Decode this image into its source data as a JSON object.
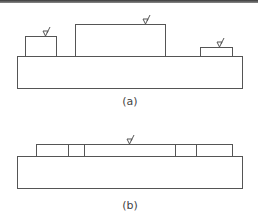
{
  "figure": {
    "panel_a": {
      "label": "(a)",
      "description": "Substrate base with three raised blocks of different heights, each marked with a surface-finish symbol",
      "base": {
        "x": 17,
        "y": 56,
        "w": 225,
        "h": 32
      },
      "blocks": [
        {
          "name": "left-block",
          "x": 25,
          "y": 36,
          "w": 31,
          "h": 20,
          "symbol_x": 45
        },
        {
          "name": "center-block",
          "x": 75,
          "y": 24,
          "w": 90,
          "h": 32,
          "symbol_x": 145
        },
        {
          "name": "right-block",
          "x": 200,
          "y": 47,
          "w": 32,
          "h": 9,
          "symbol_x": 219
        }
      ]
    },
    "panel_b": {
      "label": "(b)",
      "description": "Substrate base with a flat, leveled top strip divided into segments; single surface-finish symbol",
      "base": {
        "x": 17,
        "y": 156,
        "w": 225,
        "h": 32
      },
      "strip": {
        "x": 36,
        "y": 144,
        "w": 196,
        "h": 12
      },
      "dividers": [
        68,
        84,
        175,
        196
      ],
      "symbol_x": 129
    },
    "colors": {
      "line": "#555555",
      "background": "#ffffff"
    }
  }
}
